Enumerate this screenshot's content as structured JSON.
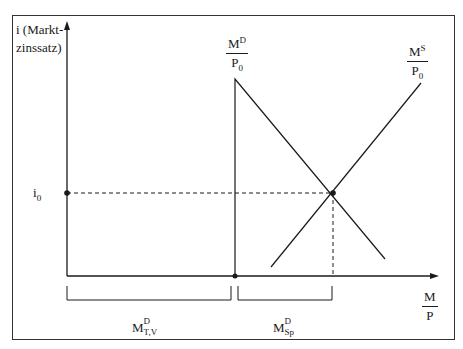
{
  "diagram": {
    "y_axis": {
      "label_line1": "i (Markt-",
      "label_line2": "zinssatz)"
    },
    "x_axis": {
      "label_num": "M",
      "label_den": "P"
    },
    "equilibrium_rate": {
      "symbol": "i",
      "subscript": "0"
    },
    "demand_curve": {
      "num_base": "M",
      "num_sup": "D",
      "den_base": "P",
      "den_sub": "0"
    },
    "supply_curve": {
      "num_base": "M",
      "num_sup": "S",
      "den_base": "P",
      "den_sub": "0"
    },
    "bracket_left": {
      "base": "M",
      "sup": "D",
      "sub": "T,V"
    },
    "bracket_right": {
      "base": "M",
      "sup": "D",
      "sub": "Sp"
    },
    "colors": {
      "line": "#1a1a1a",
      "frame": "#333333",
      "background": "#ffffff"
    }
  }
}
